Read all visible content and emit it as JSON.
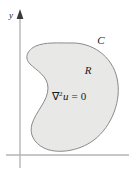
{
  "figure": {
    "type": "math-diagram",
    "background_color": "#ffffff",
    "axes": {
      "y_axis_label": "y",
      "axis_color": "#b3b3b3",
      "arrow_color": "#2b2b2b",
      "y_axis_x": 20,
      "y_axis_top": 14,
      "y_axis_bottom": 168,
      "x_axis_y": 155,
      "x_axis_left": 6,
      "x_axis_right": 129
    },
    "region": {
      "boundary_label": "C",
      "interior_label": "R",
      "fill_color": "#e8e8e6",
      "stroke_color": "#8a8a8a",
      "stroke_width": 1
    },
    "equation": {
      "operator": "∇",
      "exponent": "2",
      "variable": "u",
      "relation": "=",
      "value": "0",
      "full_text": "∇2u = 0"
    },
    "label_positions": {
      "y_label_x": 11,
      "y_label_y": 16,
      "c_label_x": 100,
      "c_label_y": 42,
      "r_label_x": 87,
      "r_label_y": 72,
      "equation_x": 52,
      "equation_y": 100
    }
  }
}
